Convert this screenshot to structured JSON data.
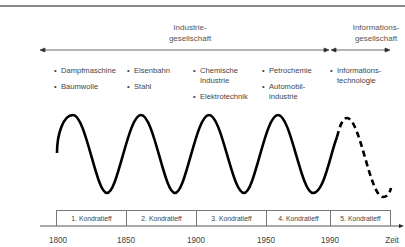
{
  "eras": [
    {
      "line1": "Industrie-",
      "line2": "gesellschaft"
    },
    {
      "line1": "Informations-",
      "line2": "gesellschaft"
    }
  ],
  "columns": [
    {
      "items": [
        [
          "Dampfmaschine"
        ],
        [
          "Baumwolle"
        ]
      ]
    },
    {
      "items": [
        [
          "Eisenbahn"
        ],
        [
          "Stahl"
        ]
      ]
    },
    {
      "items": [
        [
          "Chemische",
          "Industrie"
        ],
        [
          "Elektrotechnik"
        ]
      ]
    },
    {
      "items": [
        [
          "Petrochemie"
        ],
        [
          "Automobil-",
          "industrie"
        ]
      ]
    },
    {
      "items": [
        [
          "Informations-",
          "technologie"
        ]
      ]
    }
  ],
  "bullet": "•",
  "kondratieffs": [
    "1. Kondratieff",
    "2. Kondratieff",
    "3. Kondratieff",
    "4. Kondratieff",
    "5. Kondratieff"
  ],
  "years": [
    "1800",
    "1850",
    "1900",
    "1950",
    "1990"
  ],
  "axis_label": "Zeit",
  "wave": {
    "solid_cycles": 4,
    "dashed_cycles": 1,
    "line_color": "#000000"
  }
}
